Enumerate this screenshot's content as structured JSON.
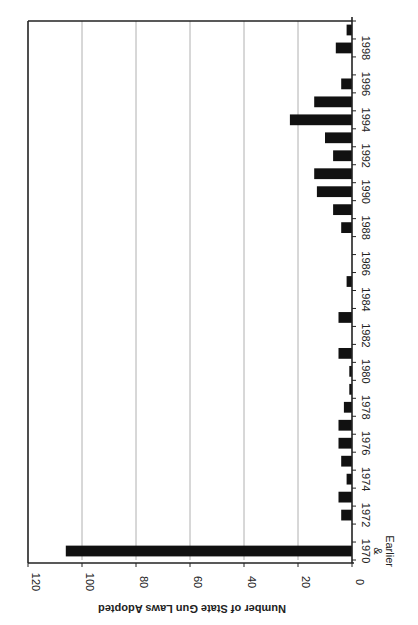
{
  "chart_data": {
    "type": "bar",
    "orientation": "rotated-90-clockwise (vertical bar chart rendered sideways)",
    "title": "",
    "xlabel": "",
    "ylabel": "Number of State Gun Laws Adopted",
    "ylim": [
      0,
      120
    ],
    "yticks": [
      0,
      20,
      40,
      60,
      80,
      100,
      120
    ],
    "grid": true,
    "legend": null,
    "categories": [
      "1970 & Earlier",
      "1971",
      "1972",
      "1973",
      "1974",
      "1975",
      "1976",
      "1977",
      "1978",
      "1979",
      "1980",
      "1981",
      "1982",
      "1983",
      "1984",
      "1985",
      "1986",
      "1987",
      "1988",
      "1989",
      "1990",
      "1991",
      "1992",
      "1993",
      "1994",
      "1995",
      "1996",
      "1997",
      "1998",
      "1999"
    ],
    "category_tick_labels": [
      "1970\n&\nEarlier",
      "1972",
      "1974",
      "1976",
      "1978",
      "1980",
      "1982",
      "1984",
      "1986",
      "1988",
      "1990",
      "1992",
      "1994",
      "1996",
      "1998"
    ],
    "series": [
      {
        "name": "State Gun Laws Adopted",
        "color": "#111111",
        "values": [
          106,
          0,
          4,
          5,
          2,
          4,
          5,
          5,
          3,
          1,
          1,
          5,
          0,
          5,
          0,
          2,
          0,
          0,
          4,
          7,
          13,
          14,
          7,
          10,
          23,
          14,
          4,
          0,
          6,
          2
        ]
      }
    ]
  },
  "labels": {
    "ylabel": "Number of State Gun Laws Adopted",
    "first_category_line1": "1970",
    "first_category_line2": "&",
    "first_category_line3": "Earlier"
  },
  "colors": {
    "bar": "#111111",
    "grid": "#b0b0b0",
    "axis": "#222222",
    "background": "#ffffff"
  }
}
